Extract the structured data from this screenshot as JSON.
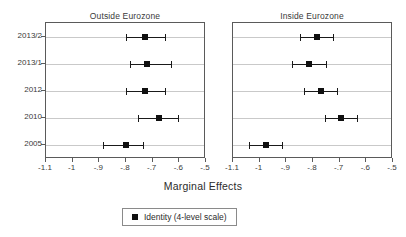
{
  "chart_data": {
    "type": "scatter",
    "title": "",
    "xlabel": "Marginal Effects",
    "ylabel": "",
    "xlim": [
      -1.1,
      -0.5
    ],
    "grid": true,
    "legend_position": "bottom-center",
    "x_ticks": [
      {
        "value": -1.1,
        "label": "-1.1"
      },
      {
        "value": -1.0,
        "label": "-1"
      },
      {
        "value": -0.9,
        "label": "-.9"
      },
      {
        "value": -0.8,
        "label": "-.8"
      },
      {
        "value": -0.7,
        "label": "-.7"
      },
      {
        "value": -0.6,
        "label": "-.6"
      },
      {
        "value": -0.5,
        "label": "-.5"
      }
    ],
    "categories": [
      "2013/2",
      "2013/1",
      "2012",
      "2010",
      "2005"
    ],
    "legend": [
      {
        "label": "Identity (4-level scale)",
        "marker": "square",
        "color": "#101010"
      }
    ],
    "panels": [
      {
        "title": "Outside Eurozone",
        "points": [
          {
            "category": "2013/2",
            "value": -0.73,
            "ci_low": -0.8,
            "ci_high": -0.655
          },
          {
            "category": "2013/1",
            "value": -0.72,
            "ci_low": -0.785,
            "ci_high": -0.63
          },
          {
            "category": "2012",
            "value": -0.73,
            "ci_low": -0.8,
            "ci_high": -0.655
          },
          {
            "category": "2010",
            "value": -0.675,
            "ci_low": -0.755,
            "ci_high": -0.605
          },
          {
            "category": "2005",
            "value": -0.8,
            "ci_low": -0.885,
            "ci_high": -0.735
          }
        ]
      },
      {
        "title": "Inside Eurozone",
        "points": [
          {
            "category": "2013/2",
            "value": -0.785,
            "ci_low": -0.85,
            "ci_high": -0.725
          },
          {
            "category": "2013/1",
            "value": -0.815,
            "ci_low": -0.88,
            "ci_high": -0.75
          },
          {
            "category": "2012",
            "value": -0.77,
            "ci_low": -0.835,
            "ci_high": -0.71
          },
          {
            "category": "2010",
            "value": -0.695,
            "ci_low": -0.755,
            "ci_high": -0.635
          },
          {
            "category": "2005",
            "value": -0.975,
            "ci_low": -1.04,
            "ci_high": -0.915
          }
        ]
      }
    ],
    "colors": {
      "marker": "#101010",
      "gridline": "#c9c9c9",
      "frame": "#5a5a5a",
      "text": "#2b2b2b"
    }
  }
}
